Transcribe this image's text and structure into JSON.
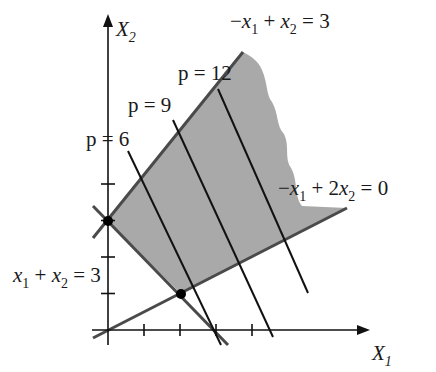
{
  "figure": {
    "type": "linear-programming feasible region",
    "axes": {
      "x_label": "X",
      "x_label_sub": "1",
      "y_label": "X",
      "y_label_sub": "2",
      "x_ticks": [
        1,
        2,
        3,
        4
      ],
      "y_ticks": [
        1,
        2,
        3,
        4
      ]
    },
    "constraints": [
      {
        "id": "c1",
        "label_parts": [
          "−",
          "x",
          "1",
          " + ",
          "x",
          "2",
          " = 3"
        ],
        "a": -1,
        "b": 1,
        "rhs": 3
      },
      {
        "id": "c2",
        "label_parts": [
          "−",
          "x",
          "1",
          " + 2",
          "x",
          "2",
          " = 0"
        ],
        "a": -1,
        "b": 2,
        "rhs": 0
      },
      {
        "id": "c3",
        "label_parts": [
          "",
          "x",
          "1",
          " + ",
          "x",
          "2",
          " = 3"
        ],
        "a": 1,
        "b": 1,
        "rhs": 3
      }
    ],
    "objective": {
      "expression": "p = 2x1 + x2",
      "coef_x1": 2,
      "coef_x2": 1
    },
    "isoprofit_lines": [
      {
        "p": 6,
        "label": "p = 6"
      },
      {
        "p": 9,
        "label": "p = 9"
      },
      {
        "p": 12,
        "label": "p = 12"
      }
    ],
    "marked_points": [
      {
        "x1": 0,
        "x2": 3
      },
      {
        "x1": 2,
        "x2": 1
      }
    ],
    "colors": {
      "region_fill": "#a9a9a9",
      "constraint_line": "#4a4a4a",
      "axis": "#111111",
      "isoprofit_line": "#111111"
    }
  }
}
